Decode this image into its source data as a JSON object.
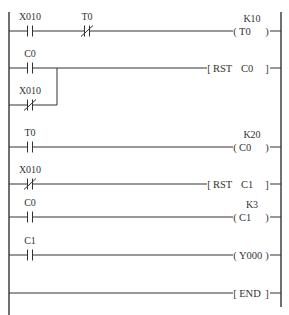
{
  "diagram": {
    "type": "ladder-logic",
    "colors": {
      "line": "#333333",
      "background": "#ffffff"
    },
    "rails": {
      "left_x": 9,
      "right_x": 281,
      "top_y": 12,
      "left_bottom_y": 315,
      "right_bottom_y": 307
    },
    "rungs": [
      {
        "y": 31,
        "contacts": [
          {
            "label": "X010",
            "type": "NO",
            "x": 30
          },
          {
            "label": "T0",
            "type": "NC",
            "x": 87
          }
        ],
        "output": {
          "kind": "coil",
          "operand": "T0",
          "preset": "K10"
        }
      },
      {
        "y": 68,
        "contacts": [
          {
            "label": "C0",
            "type": "NO",
            "x": 30
          }
        ],
        "branch": {
          "y": 105,
          "join_x": 57,
          "contacts": [
            {
              "label": "X010",
              "type": "NC",
              "x": 30
            }
          ]
        },
        "output": {
          "kind": "instruction",
          "op": "RST",
          "operand": "C0"
        }
      },
      {
        "y": 147,
        "contacts": [
          {
            "label": "T0",
            "type": "NO",
            "x": 30
          }
        ],
        "output": {
          "kind": "coil",
          "operand": "C0",
          "preset": "K20"
        }
      },
      {
        "y": 184,
        "contacts": [
          {
            "label": "X010",
            "type": "NC",
            "x": 30
          }
        ],
        "output": {
          "kind": "instruction",
          "op": "RST",
          "operand": "C1"
        }
      },
      {
        "y": 217,
        "contacts": [
          {
            "label": "C0",
            "type": "NO",
            "x": 30
          }
        ],
        "output": {
          "kind": "coil",
          "operand": "C1",
          "preset": "K3"
        }
      },
      {
        "y": 255,
        "contacts": [
          {
            "label": "C1",
            "type": "NO",
            "x": 30
          }
        ],
        "output": {
          "kind": "coil",
          "operand": "Y000",
          "preset": ""
        }
      },
      {
        "y": 293,
        "contacts": [],
        "output": {
          "kind": "end",
          "op": "END"
        }
      }
    ]
  }
}
